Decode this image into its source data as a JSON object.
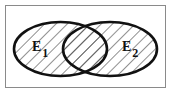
{
  "diagram": {
    "type": "venn",
    "sets": [
      {
        "id": "E1",
        "label": "E",
        "subscript": "1",
        "shaded": true
      },
      {
        "id": "E2",
        "label": "E",
        "subscript": "2",
        "shaded": true
      }
    ],
    "shading": "diagonal hatch (union E1 ∪ E2)",
    "colors": {
      "stroke": "#111111",
      "hatch": "#333333",
      "frame": "#8a8a8a",
      "background": "#ffffff"
    }
  }
}
